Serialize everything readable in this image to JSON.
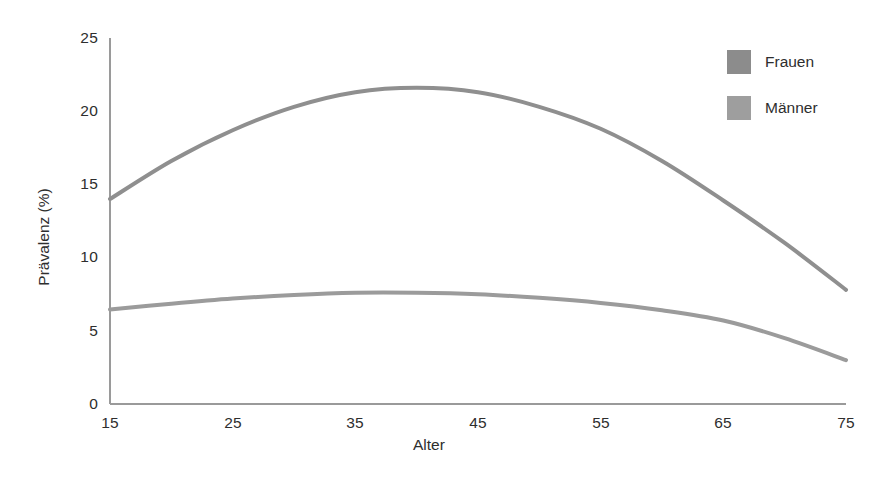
{
  "chart_data": {
    "type": "line",
    "title": "",
    "xlabel": "Alter",
    "ylabel": "Prävalenz  (%)",
    "xlim": [
      15,
      75
    ],
    "ylim": [
      0,
      25
    ],
    "xticks": [
      15,
      25,
      35,
      45,
      55,
      65,
      75
    ],
    "yticks": [
      0,
      5,
      10,
      15,
      20,
      25
    ],
    "grid": false,
    "legend_position": "top-right",
    "x": [
      15,
      20,
      25,
      30,
      35,
      40,
      45,
      50,
      55,
      60,
      65,
      70,
      75
    ],
    "series": [
      {
        "name": "Frauen",
        "color": "#8f8f8f",
        "values": [
          14.0,
          16.6,
          18.7,
          20.3,
          21.3,
          21.6,
          21.3,
          20.3,
          18.8,
          16.6,
          13.9,
          11.0,
          7.8
        ]
      },
      {
        "name": "Männer",
        "color": "#9b9b9b",
        "values": [
          6.45,
          6.85,
          7.2,
          7.45,
          7.6,
          7.6,
          7.5,
          7.25,
          6.9,
          6.4,
          5.7,
          4.5,
          3.0
        ]
      }
    ]
  },
  "axes": {
    "y_ticks": [
      "25",
      "20",
      "15",
      "10",
      "5",
      "0"
    ],
    "x_ticks": [
      "15",
      "25",
      "35",
      "45",
      "55",
      "65",
      "75"
    ],
    "y_title": "Prävalenz  (%)",
    "x_title": "Alter",
    "axis_color": "#9a9a9a"
  },
  "legend": {
    "items": [
      {
        "label": "Frauen",
        "color": "#8c8c8c"
      },
      {
        "label": "Männer",
        "color": "#9e9e9e"
      }
    ]
  }
}
